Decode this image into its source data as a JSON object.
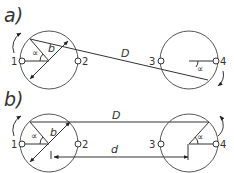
{
  "panels": [
    {
      "label": "a)",
      "distance_label": "D",
      "radius_label": "b",
      "angle_label_left": "∝",
      "angle_label_right": "∝",
      "points": [
        "1",
        "2",
        "3",
        "4"
      ]
    },
    {
      "label": "b)",
      "distance_label": "D",
      "distance_label_inner": "d",
      "radius_label": "b",
      "angle_label_left": "∝",
      "angle_label_right": "∝",
      "points": [
        "1",
        "2",
        "3",
        "4"
      ]
    }
  ],
  "colors": {
    "line": "#333333",
    "background": "#ffffff"
  }
}
